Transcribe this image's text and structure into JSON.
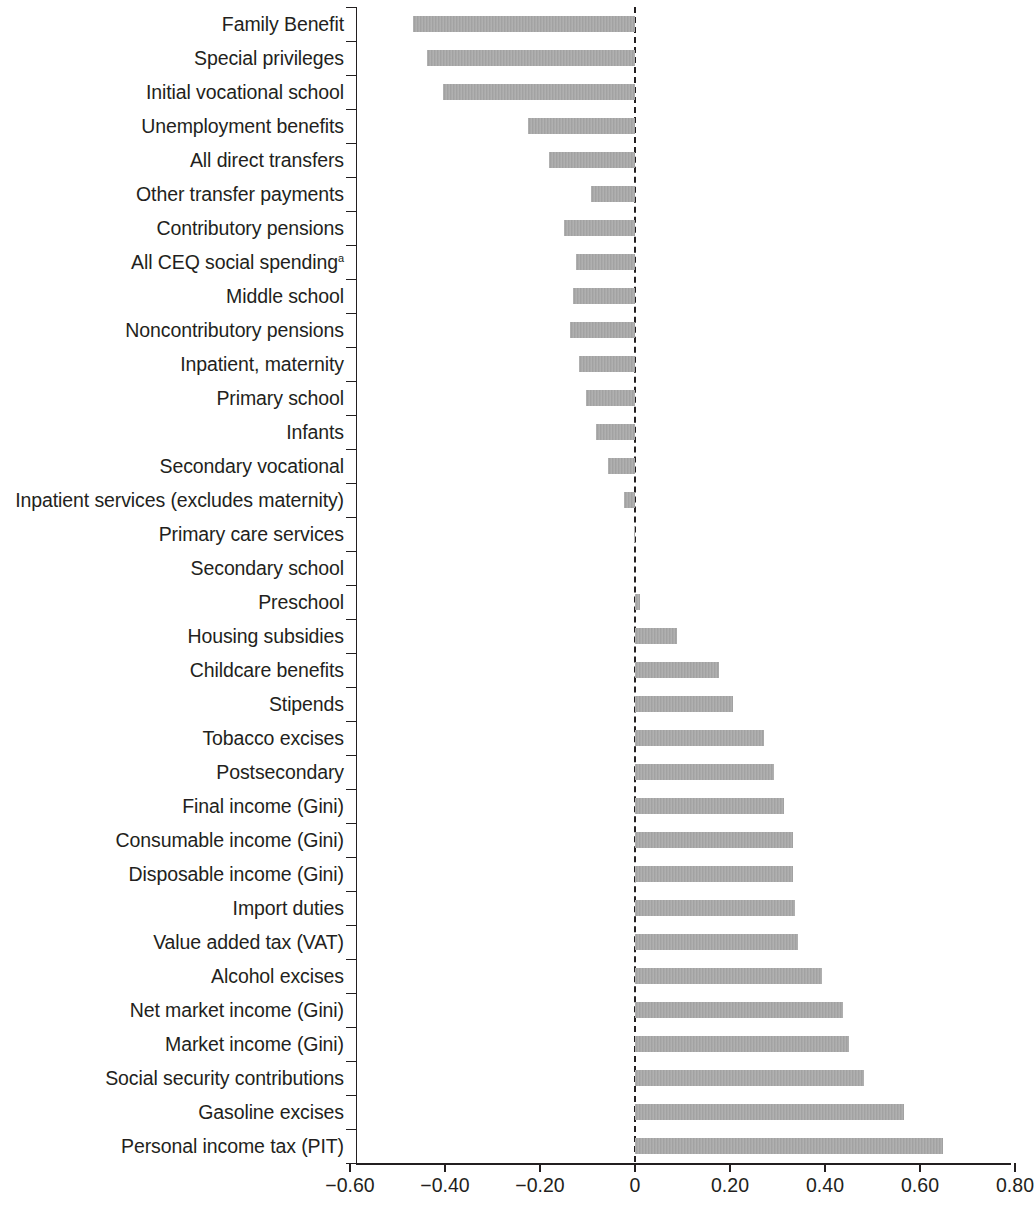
{
  "chart_data": {
    "type": "bar",
    "orientation": "horizontal",
    "title": "",
    "subtitle": "",
    "xlabel": "",
    "ylabel": "",
    "xlim": [
      -0.6,
      0.8
    ],
    "xticks": [
      -0.6,
      -0.4,
      -0.2,
      0,
      0.2,
      0.4,
      0.6,
      0.8
    ],
    "xtick_labels": [
      "−0.60",
      "−0.40",
      "−0.20",
      "0",
      "0.20",
      "0.40",
      "0.60",
      "0.80"
    ],
    "grid": false,
    "legend": null,
    "zero_reference_line": true,
    "bar_color": "#a6a6a6",
    "axis_color": "#231f20",
    "categories": [
      "Family Benefit",
      "Special privileges",
      "Initial vocational school",
      "Unemployment benefits",
      "All direct transfers",
      "Other transfer payments",
      "Contributory pensions",
      "All CEQ social spending",
      "Middle school",
      "Noncontributory pensions",
      "Inpatient, maternity",
      "Primary school",
      "Infants",
      "Secondary vocational",
      "Inpatient services (excludes maternity)",
      "Primary care services",
      "Secondary school",
      "Preschool",
      "Housing subsidies",
      "Childcare benefits",
      "Stipends",
      "Tobacco excises",
      "Postsecondary",
      "Final income (Gini)",
      "Consumable income (Gini)",
      "Disposable income (Gini)",
      "Import duties",
      "Value added tax (VAT)",
      "Alcohol excises",
      "Net market income (Gini)",
      "Market income (Gini)",
      "Social security contributions",
      "Gasoline excises",
      "Personal income tax (PIT)"
    ],
    "values": [
      -0.467,
      -0.437,
      -0.405,
      -0.225,
      -0.181,
      -0.093,
      -0.149,
      -0.124,
      -0.13,
      -0.137,
      -0.118,
      -0.103,
      -0.082,
      -0.057,
      -0.023,
      -0.003,
      0.0,
      0.011,
      0.088,
      0.177,
      0.207,
      0.272,
      0.293,
      0.314,
      0.333,
      0.333,
      0.337,
      0.343,
      0.394,
      0.438,
      0.451,
      0.482,
      0.566,
      0.648
    ],
    "footnote_markers": {
      "All CEQ social spending": "a"
    }
  }
}
